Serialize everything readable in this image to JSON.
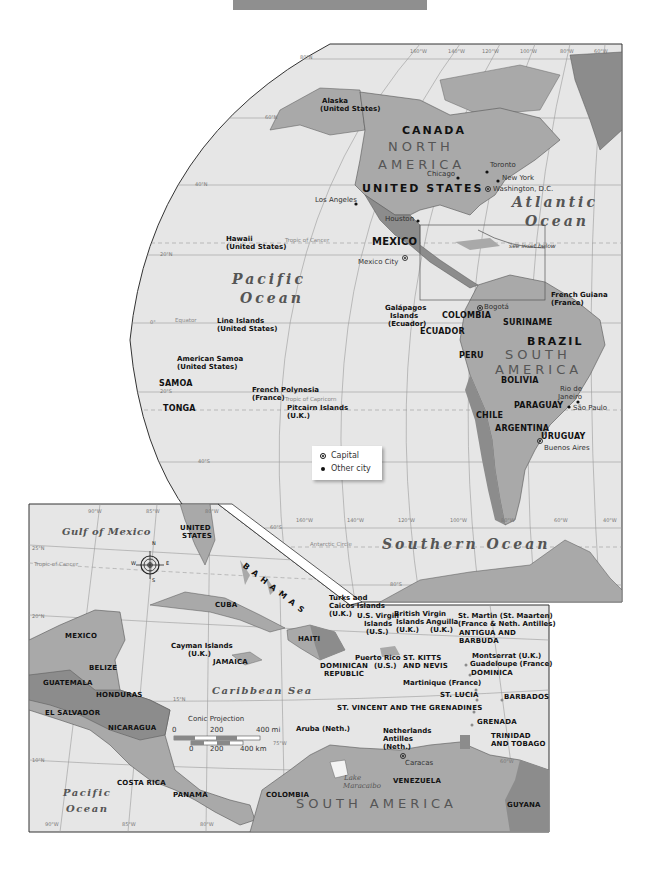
{
  "header_bar": {
    "color": "#8f8f8f"
  },
  "main_map": {
    "longitude_labels_top": [
      "160°W",
      "140°W",
      "120°W",
      "100°W",
      "80°W",
      "60°W"
    ],
    "longitude_labels_bottom": [
      "160°W",
      "140°W",
      "120°W",
      "100°W",
      "80°W",
      "60°W",
      "40°W"
    ],
    "latitude_labels": [
      "80°N",
      "60°N",
      "40°N",
      "20°N",
      "0°",
      "20°S",
      "40°S",
      "60°S",
      "80°S"
    ],
    "special_lines": {
      "tropic_cancer": "Tropic of Cancer",
      "equator": "Equator",
      "tropic_capricorn": "Tropic of Capricorn",
      "antarctic_circle": "Antarctic Circle"
    },
    "continents": {
      "north_america_1": "NORTH",
      "north_america_2": "AMERICA",
      "south_america_1": "SOUTH",
      "south_america_2": "AMERICA"
    },
    "oceans": {
      "pacific_1": "Pacific",
      "pacific_2": "Ocean",
      "atlantic_1": "Atlantic",
      "atlantic_2": "Ocean",
      "southern": "Southern Ocean"
    },
    "countries": [
      "CANADA",
      "UNITED STATES",
      "MEXICO",
      "COLOMBIA",
      "ECUADOR",
      "SURINAME",
      "BRAZIL",
      "PERU",
      "BOLIVIA",
      "PARAGUAY",
      "CHILE",
      "ARGENTINA",
      "URUGUAY",
      "SAMOA",
      "TONGA"
    ],
    "territories": {
      "alaska_1": "Alaska",
      "alaska_2": "(United States)",
      "hawaii_1": "Hawaii",
      "hawaii_2": "(United States)",
      "line_1": "Line Islands",
      "line_2": "(United States)",
      "samoa_am_1": "American Samoa",
      "samoa_am_2": "(United States)",
      "fp_1": "French Polynesia",
      "fp_2": "(France)",
      "pitcairn_1": "Pitcairn Islands",
      "pitcairn_2": "(U.K.)",
      "galapagos_1": "Galápagos",
      "galapagos_2": "Islands",
      "galapagos_3": "(Ecuador)",
      "fg_1": "French Guiana",
      "fg_2": "(France)"
    },
    "cities": {
      "toronto": "Toronto",
      "chicago": "Chicago",
      "new_york": "New York",
      "washington": "Washington, D.C.",
      "los_angeles": "Los Angeles",
      "houston": "Houston",
      "mexico_city": "Mexico City",
      "bogota": "Bogotá",
      "rio_1": "Rio de",
      "rio_2": "Janeiro",
      "sao_paulo": "São Paulo",
      "buenos_aires": "Buenos Aires"
    },
    "inset_note": "see inset below"
  },
  "legend": {
    "capital": "Capital",
    "other_city": "Other city"
  },
  "inset_map": {
    "longitude_labels": [
      "90°W",
      "85°W",
      "80°W",
      "75°W",
      "60°W"
    ],
    "latitude_labels": [
      "25°N",
      "20°N",
      "15°N",
      "10°N"
    ],
    "tropic": "Tropic of Cancer",
    "compass": {
      "n": "N",
      "s": "S",
      "e": "E",
      "w": "W"
    },
    "oceans": {
      "gulf": "Gulf of Mexico",
      "caribbean": "Caribbean Sea",
      "pacific_1": "Pacific",
      "pacific_2": "Ocean",
      "lake_1": "Lake",
      "lake_2": "Maracaibo"
    },
    "continent": "SOUTH AMERICA",
    "countries": {
      "us_1": "UNITED",
      "us_2": "STATES",
      "bahamas": "BAHAMAS",
      "cuba": "CUBA",
      "mexico": "MEXICO",
      "belize": "BELIZE",
      "guatemala": "GUATEMALA",
      "honduras": "HONDURAS",
      "el_salvador": "EL SALVADOR",
      "nicaragua": "NICARAGUA",
      "costa_rica": "COSTA RICA",
      "panama": "PANAMA",
      "colombia": "COLOMBIA",
      "venezuela": "VENEZUELA",
      "guyana": "GUYANA",
      "jamaica": "JAMAICA",
      "haiti": "HAITI",
      "dr_1": "DOMINICAN",
      "dr_2": "REPUBLIC",
      "skn_1": "ST. KITTS",
      "skn_2": "AND NEVIS",
      "ab_1": "ANTIGUA AND",
      "ab_2": "BARBUDA",
      "dominica": "DOMINICA",
      "st_lucia": "ST. LUCIA",
      "barbados": "BARBADOS",
      "svg": "ST. VINCENT AND THE GRENADINES",
      "grenada": "GRENADA",
      "tt_1": "TRINIDAD",
      "tt_2": "AND TOBAGO"
    },
    "territories": {
      "cayman_1": "Cayman Islands",
      "cayman_2": "(U.K.)",
      "tci_1": "Turks and",
      "tci_2": "Caicos Islands",
      "tci_3": "(U.K.)",
      "usvi_1": "U.S. Virgin",
      "usvi_2": "Islands",
      "usvi_3": "(U.S.)",
      "bvi_1": "British Virgin",
      "bvi_2": "Islands",
      "bvi_3": "(U.K.)",
      "anguilla_1": "Anguilla",
      "anguilla_2": "(U.K.)",
      "stmartin_1": "St. Martin (St. Maarten)",
      "stmartin_2": "(France & Neth. Antilles)",
      "pr_1": "Puerto Rico",
      "pr_2": "(U.S.)",
      "montserrat": "Montserrat (U.K.)",
      "guadeloupe": "Guadeloupe (France)",
      "martinique": "Martinique (France)",
      "aruba": "Aruba (Neth.)",
      "na_1": "Netherlands",
      "na_2": "Antilles",
      "na_3": "(Neth.)"
    },
    "cities": {
      "caracas": "Caracas"
    },
    "scale": {
      "title": "Conic Projection",
      "mi_0": "0",
      "mi_200": "200",
      "mi_400": "400 mi",
      "km_0": "0",
      "km_200": "200",
      "km_400": "400 km"
    }
  },
  "colors": {
    "land": "#a9a9a9",
    "land_dark": "#8c8c8c",
    "ocean": "#e6e6e6",
    "border": "#555555",
    "grid": "#9a9a9a"
  }
}
